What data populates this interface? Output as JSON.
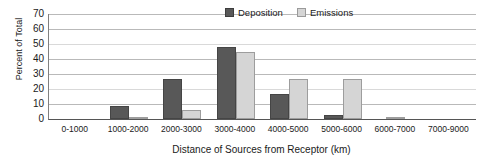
{
  "chart_data": {
    "type": "bar",
    "title": "",
    "xlabel": "Distance of Sources from Receptor (km)",
    "ylabel": "Percent of Total",
    "ylim": [
      0,
      70
    ],
    "yticks": [
      0,
      10,
      20,
      30,
      40,
      50,
      60,
      70
    ],
    "grid": true,
    "legend_position": "top-right",
    "categories": [
      "0-1000",
      "1000-2000",
      "2000-3000",
      "3000-4000",
      "4000-5000",
      "5000-6000",
      "6000-7000",
      "7000-9000"
    ],
    "series": [
      {
        "name": "Deposition",
        "color": "#585858",
        "values": [
          0,
          9,
          27,
          48,
          17,
          3,
          0,
          0
        ]
      },
      {
        "name": "Emissions",
        "color": "#d5d5d5",
        "values": [
          0,
          1,
          6,
          45,
          27,
          27,
          1,
          0
        ]
      }
    ]
  },
  "legend": {
    "items": [
      {
        "label": "Deposition",
        "swatch": "legend-swatch-deposition"
      },
      {
        "label": "Emissions",
        "swatch": "legend-swatch-emissions"
      }
    ]
  },
  "axes": {
    "y_title": "Percent of Total",
    "x_title": "Distance of Sources from Receptor (km)",
    "y_tick_labels": [
      "70",
      "60",
      "50",
      "40",
      "30",
      "20",
      "10",
      "0"
    ]
  }
}
